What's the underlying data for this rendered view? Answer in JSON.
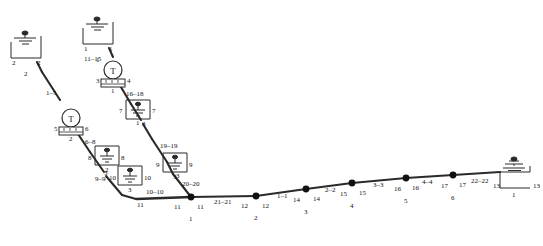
{
  "diagram": {
    "type": "single-line-electrical-network",
    "colors": {
      "line": "#2a2a2a",
      "node": "#111111",
      "text": "#111111",
      "background": "#ffffff"
    },
    "source_terminals": [
      {
        "id": "src-top",
        "icon": "ground-symbol",
        "left_label": "1",
        "right_label": "1",
        "bottom_label": "1"
      },
      {
        "id": "src-left",
        "icon": "ground-symbol",
        "left_label": "2",
        "right_label": "2",
        "bottom_label": "2"
      },
      {
        "id": "tap-16-18",
        "icon": "ground-symbol",
        "left_label": "7",
        "right_label": "7",
        "bottom_label": "1"
      },
      {
        "id": "tap-6-8",
        "icon": "ground-symbol",
        "left_label": "8",
        "right_label": "8",
        "bottom_label": "2"
      },
      {
        "id": "tap-19-19",
        "icon": "ground-symbol",
        "left_label": "9",
        "right_label": "9",
        "bottom_label": "3"
      },
      {
        "id": "tap-9-9",
        "icon": "ground-symbol",
        "left_label": "10",
        "right_label": "10",
        "bottom_label": "3"
      },
      {
        "id": "end-22-22",
        "icon": "ground-symbol",
        "left_label": "13",
        "right_label": "13",
        "bottom_label": "1"
      }
    ],
    "transformers": [
      {
        "id": "tf-upper",
        "symbol": "T",
        "left_label": "3",
        "right_label": "4",
        "bottom_label": "1",
        "box_label": "u r r"
      },
      {
        "id": "tf-lower",
        "symbol": "T",
        "left_label": "5",
        "right_label": "6",
        "bottom_label": "2",
        "box_label": "u r r"
      }
    ],
    "branch_labels": [
      {
        "id": "b-11-15",
        "text": "11–15"
      },
      {
        "id": "b-1-5",
        "text": "1–5"
      },
      {
        "id": "b-16-18",
        "text": "16–18"
      },
      {
        "id": "b-6-8",
        "text": "6–8"
      },
      {
        "id": "b-19-19",
        "text": "19–19"
      },
      {
        "id": "b-9-9",
        "text": "9–9"
      },
      {
        "id": "b-20-20",
        "text": "20–20"
      },
      {
        "id": "b-10-10",
        "text": "10–10"
      },
      {
        "id": "b-21-21",
        "text": "21–21"
      },
      {
        "id": "b-1-1",
        "text": "1–1"
      },
      {
        "id": "b-2-2",
        "text": "2–2"
      },
      {
        "id": "b-3-3",
        "text": "3–3"
      },
      {
        "id": "b-4-4",
        "text": "4–4"
      },
      {
        "id": "b-22-22",
        "text": "22–22"
      }
    ],
    "feeder_nodes": [
      {
        "id": "n1",
        "bus": "11",
        "index": "1"
      },
      {
        "id": "n2",
        "bus": "12",
        "index": "2"
      },
      {
        "id": "n3",
        "bus": "14",
        "index": "3"
      },
      {
        "id": "n4",
        "bus": "15",
        "index": "4"
      },
      {
        "id": "n5",
        "bus": "16",
        "index": "5"
      },
      {
        "id": "n6",
        "bus": "17",
        "index": "6"
      },
      {
        "id": "n7",
        "bus": "13",
        "index": "1"
      }
    ],
    "node_side_labels": [
      {
        "id": "s-11-right",
        "text": "11"
      },
      {
        "id": "s-12-left",
        "text": "12"
      },
      {
        "id": "s-12-right",
        "text": "12"
      },
      {
        "id": "s-14-left",
        "text": "14"
      },
      {
        "id": "s-14-right",
        "text": "14"
      },
      {
        "id": "s-15-left",
        "text": "15"
      },
      {
        "id": "s-15-right",
        "text": "15"
      },
      {
        "id": "s-16-left",
        "text": "16"
      },
      {
        "id": "s-16-right",
        "text": "16"
      },
      {
        "id": "s-17-left",
        "text": "17"
      },
      {
        "id": "s-17-right",
        "text": "17"
      },
      {
        "id": "s-13-left",
        "text": "13"
      }
    ],
    "junction_labels": [
      {
        "id": "j-3-a",
        "text": "3"
      },
      {
        "id": "j-3-b",
        "text": "3"
      },
      {
        "id": "j-3-c",
        "text": "3"
      },
      {
        "id": "j-11",
        "text": "11"
      }
    ]
  }
}
